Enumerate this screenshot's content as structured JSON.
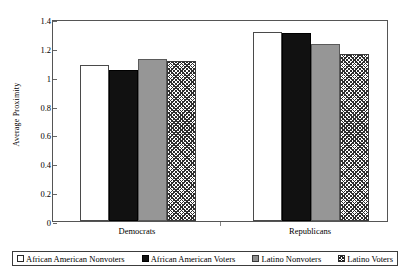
{
  "chart_data": {
    "type": "bar",
    "title": "",
    "xlabel": "",
    "ylabel": "Average Proximity",
    "ylim": [
      0,
      1.4
    ],
    "yticks": [
      "0",
      "0.2",
      "0.4",
      "0.6",
      "0.8",
      "1",
      "1.2",
      "1.4"
    ],
    "ytick_values": [
      0,
      0.2,
      0.4,
      0.6,
      0.8,
      1.0,
      1.2,
      1.4
    ],
    "grid": false,
    "legend_position": "bottom",
    "categories": [
      "Democrats",
      "Republicans"
    ],
    "series": [
      {
        "name": "African American Nonvoters",
        "fill": "white",
        "values": [
          1.08,
          1.31
        ]
      },
      {
        "name": "African American Voters",
        "fill": "black",
        "values": [
          1.05,
          1.3
        ]
      },
      {
        "name": "Latino Nonvoters",
        "fill": "gray",
        "values": [
          1.12,
          1.23
        ]
      },
      {
        "name": "Latino Voters",
        "fill": "hatch",
        "values": [
          1.11,
          1.16
        ]
      }
    ]
  },
  "legend": {
    "items": [
      {
        "label": "African American Nonvoters",
        "fill": "white"
      },
      {
        "label": "African American Voters",
        "fill": "black"
      },
      {
        "label": "Latino Nonvoters",
        "fill": "gray"
      },
      {
        "label": "Latino Voters",
        "fill": "hatch"
      }
    ]
  },
  "colors": {
    "white_fill": "#ffffff",
    "black_fill": "#111111",
    "gray_fill": "#969696",
    "hatch_line": "#2e2e2e",
    "axis": "#555555",
    "text": "#000000"
  }
}
